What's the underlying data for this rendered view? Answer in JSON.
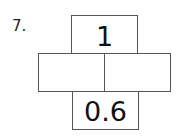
{
  "question": {
    "number_label": "7."
  },
  "number_bond": {
    "top": "1",
    "middle_left": "",
    "middle_right": "",
    "bottom": "0.6"
  }
}
